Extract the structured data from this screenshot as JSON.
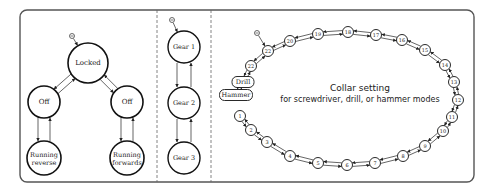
{
  "frame": {
    "x": 20,
    "y": 10,
    "w": 454,
    "h": 172,
    "radius": 7,
    "stroke": "#555555"
  },
  "dividers": [
    {
      "x": 157
    },
    {
      "x": 211
    }
  ],
  "panel_power": {
    "title": "Power states",
    "states": [
      {
        "id": "locked",
        "label": "Locked",
        "x": 88,
        "y": 63,
        "r": 20,
        "initial": true
      },
      {
        "id": "off_left",
        "label": "Off",
        "x": 44,
        "y": 102,
        "r": 16
      },
      {
        "id": "off_right",
        "label": "Off",
        "x": 127,
        "y": 102,
        "r": 16
      },
      {
        "id": "running_reverse",
        "label_lines": [
          "Running",
          "reverse"
        ],
        "x": 44,
        "y": 158,
        "r": 17
      },
      {
        "id": "running_forwards",
        "label_lines": [
          "Running",
          "forwards"
        ],
        "x": 127,
        "y": 158,
        "r": 17
      }
    ]
  },
  "panel_gear": {
    "states": [
      {
        "id": "gear1",
        "label": "Gear 1",
        "x": 184,
        "y": 47,
        "r": 16,
        "initial": true
      },
      {
        "id": "gear2",
        "label": "Gear 2",
        "x": 184,
        "y": 103,
        "r": 16
      },
      {
        "id": "gear3",
        "label": "Gear 3",
        "x": 184,
        "y": 158,
        "r": 16
      }
    ]
  },
  "panel_collar": {
    "caption_line1": "Collar setting",
    "caption_line2": "for screwdriver, drill, or hammer modes",
    "ring": [
      {
        "label": "1",
        "x": 240,
        "y": 116
      },
      {
        "label": "2",
        "x": 251,
        "y": 130
      },
      {
        "label": "3",
        "x": 267,
        "y": 142
      },
      {
        "label": "4",
        "x": 290,
        "y": 156
      },
      {
        "label": "5",
        "x": 318,
        "y": 163
      },
      {
        "label": "6",
        "x": 347,
        "y": 165
      },
      {
        "label": "7",
        "x": 375,
        "y": 163
      },
      {
        "label": "8",
        "x": 403,
        "y": 156
      },
      {
        "label": "9",
        "x": 425,
        "y": 146
      },
      {
        "label": "10",
        "x": 443,
        "y": 131
      },
      {
        "label": "11",
        "x": 452,
        "y": 117
      },
      {
        "label": "12",
        "x": 458,
        "y": 100
      },
      {
        "label": "13",
        "x": 454,
        "y": 82
      },
      {
        "label": "14",
        "x": 445,
        "y": 65
      },
      {
        "label": "15",
        "x": 425,
        "y": 50
      },
      {
        "label": "16",
        "x": 402,
        "y": 40
      },
      {
        "label": "17",
        "x": 376,
        "y": 35
      },
      {
        "label": "18",
        "x": 348,
        "y": 32
      },
      {
        "label": "19",
        "x": 318,
        "y": 34
      },
      {
        "label": "20",
        "x": 290,
        "y": 41
      },
      {
        "label": "22",
        "x": 268,
        "y": 51,
        "initial": true
      },
      {
        "label": "22",
        "x": 251,
        "y": 66
      }
    ],
    "modes": [
      {
        "label": "Drill",
        "x": 243,
        "y": 82,
        "w": 22,
        "h": 11
      },
      {
        "label": "Hammer",
        "x": 236,
        "y": 95,
        "w": 33,
        "h": 11
      }
    ]
  }
}
